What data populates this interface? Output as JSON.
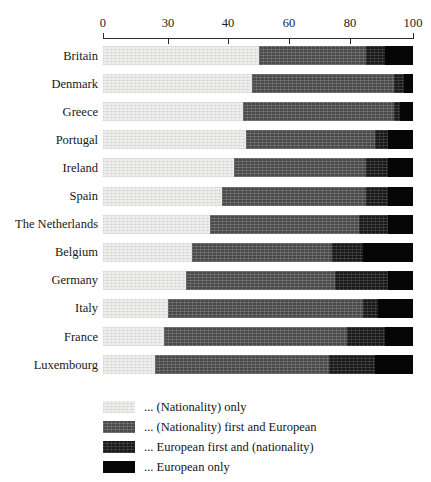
{
  "chart_data": {
    "type": "bar",
    "subtype": "horizontal-stacked-100",
    "title": "",
    "xlabel": "",
    "ylabel": "",
    "grid": false,
    "legend_position": "bottom",
    "xlim": [
      0,
      100
    ],
    "axis_is_broken": true,
    "tick_labels": [
      "0",
      "30",
      "40",
      "60",
      "80",
      "100"
    ],
    "tick_values": [
      0,
      30,
      40,
      60,
      80,
      100
    ],
    "tick_px": [
      103,
      168,
      228,
      289,
      350,
      413
    ],
    "categories": [
      "Britain",
      "Denmark",
      "Greece",
      "Portugal",
      "Ireland",
      "Spain",
      "The Netherlands",
      "Belgium",
      "Germany",
      "Italy",
      "France",
      "Luxembourg"
    ],
    "series": [
      {
        "name": "... (Nationality) only",
        "color": "#eeeeec",
        "values": [
          50,
          48,
          45,
          46,
          42,
          39,
          37,
          34,
          33,
          30,
          28,
          24
        ]
      },
      {
        "name": "... (Nationality) first and European",
        "color": "#4a4a4a",
        "values": [
          35,
          46,
          49,
          42,
          43,
          46,
          46,
          40,
          42,
          54,
          51,
          49
        ]
      },
      {
        "name": "... European first and (nationality)",
        "color": "#191919",
        "values": [
          6,
          3,
          2,
          4,
          7,
          7,
          9,
          10,
          17,
          5,
          12,
          15
        ]
      },
      {
        "name": "... European only",
        "color": "#060606",
        "values": [
          9,
          3,
          4,
          8,
          8,
          8,
          8,
          16,
          8,
          11,
          9,
          12
        ]
      }
    ]
  },
  "legend": {
    "items": [
      {
        "label": "... (Nationality) only",
        "swatch": "s0"
      },
      {
        "label": "... (Nationality) first and European",
        "swatch": "s1"
      },
      {
        "label": "... European first and (nationality)",
        "swatch": "s2"
      },
      {
        "label": "... European only",
        "swatch": "s3"
      }
    ]
  }
}
